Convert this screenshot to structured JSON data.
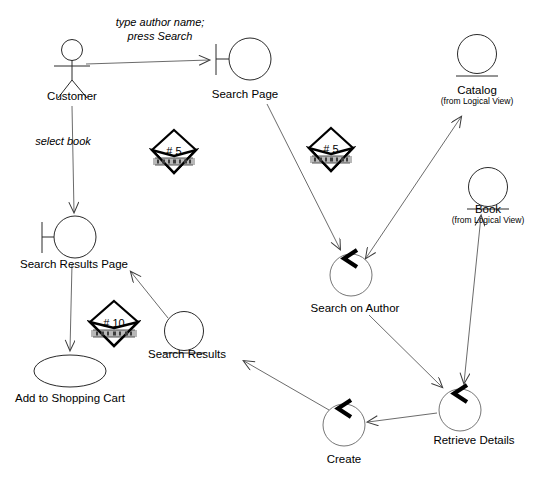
{
  "diagram": {
    "type": "uml-collaboration-diagram",
    "width": 547,
    "height": 479,
    "background_color": "#ffffff",
    "stroke_color": "#000000",
    "nodes": [
      {
        "id": "customer",
        "label": "Customer",
        "sublabel": "",
        "icon": "actor-stick-figure",
        "x": 72,
        "y": 62,
        "label_x": 72,
        "label_y": 90
      },
      {
        "id": "search-page",
        "label": "Search Page",
        "sublabel": "",
        "icon": "boundary",
        "x": 250,
        "y": 59,
        "label_x": 245,
        "label_y": 88
      },
      {
        "id": "catalog",
        "label": "Catalog",
        "sublabel": "(from Logical View)",
        "icon": "entity",
        "x": 477,
        "y": 54,
        "label_x": 477,
        "label_y": 84
      },
      {
        "id": "book",
        "label": "Book",
        "sublabel": "(from Logical View)",
        "icon": "entity",
        "x": 488,
        "y": 187,
        "label_x": 488,
        "label_y": 203
      },
      {
        "id": "search-results-page",
        "label": "Search Results Page",
        "sublabel": "",
        "icon": "boundary",
        "x": 75,
        "y": 237,
        "label_x": 74,
        "label_y": 258
      },
      {
        "id": "search-on-author",
        "label": "Search on Author",
        "sublabel": "",
        "icon": "control",
        "x": 351,
        "y": 275,
        "label_x": 355,
        "label_y": 302
      },
      {
        "id": "search-results",
        "label": "Search Results",
        "sublabel": "",
        "icon": "entity",
        "x": 184,
        "y": 331,
        "label_x": 187,
        "label_y": 348
      },
      {
        "id": "add-to-shopping-cart",
        "label": "Add to Shopping Cart",
        "sublabel": "",
        "icon": "use-case-ellipse",
        "x": 70,
        "y": 371,
        "label_x": 70,
        "label_y": 392
      },
      {
        "id": "retrieve-details",
        "label": "Retrieve Details",
        "sublabel": "",
        "icon": "control",
        "x": 460,
        "y": 410,
        "label_x": 474,
        "label_y": 434
      },
      {
        "id": "create",
        "label": "Create",
        "sublabel": "",
        "icon": "control",
        "x": 344,
        "y": 425,
        "label_x": 344,
        "label_y": 453
      }
    ],
    "messages": [
      {
        "id": "type-author-name",
        "text_line1": "type author name;",
        "text_line2": "press Search",
        "x": 160,
        "y": 16,
        "from": "customer",
        "to": "search-page"
      },
      {
        "id": "select-book",
        "text_line1": "select book",
        "text_line2": "",
        "x": 63,
        "y": 135,
        "from": "customer",
        "to": "search-results-page"
      }
    ],
    "sequence_markers": [
      {
        "id": "marker-5-left",
        "number": "# 5",
        "x": 174,
        "y": 152
      },
      {
        "id": "marker-5-right",
        "number": "# 5",
        "x": 331,
        "y": 150
      },
      {
        "id": "marker-10",
        "number": "# 10",
        "x": 114,
        "y": 324
      }
    ],
    "links": [
      {
        "id": "customer-to-search-page",
        "from": "customer",
        "to": "search-page",
        "arrow": "single"
      },
      {
        "id": "customer-to-search-results-page",
        "from": "customer",
        "to": "search-results-page",
        "arrow": "single"
      },
      {
        "id": "search-page-to-search-on-author",
        "from": "search-page",
        "to": "search-on-author",
        "arrow": "single"
      },
      {
        "id": "search-on-author-to-catalog",
        "from": "search-on-author",
        "to": "catalog",
        "arrow": "double"
      },
      {
        "id": "search-on-author-to-retrieve-details",
        "from": "search-on-author",
        "to": "retrieve-details",
        "arrow": "single"
      },
      {
        "id": "book-to-retrieve-details",
        "from": "book",
        "to": "retrieve-details",
        "arrow": "double"
      },
      {
        "id": "retrieve-details-to-create",
        "from": "retrieve-details",
        "to": "create",
        "arrow": "single"
      },
      {
        "id": "create-to-search-results",
        "from": "create",
        "to": "search-results",
        "arrow": "single"
      },
      {
        "id": "search-results-to-search-results-page",
        "from": "search-results",
        "to": "search-results-page",
        "arrow": "single"
      },
      {
        "id": "search-results-page-to-cart",
        "from": "search-results-page",
        "to": "add-to-shopping-cart",
        "arrow": "single"
      }
    ]
  }
}
